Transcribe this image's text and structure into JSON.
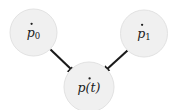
{
  "diagram": {
    "type": "directed-acyclic-graph",
    "background_color": "#ffffff",
    "node_fill_color": "#f0f0f0",
    "node_stroke_color": "#e2e2e2",
    "edge_color": "#1a1a1a",
    "label_color": "#202020",
    "nodes": [
      {
        "id": "p-dot-0",
        "base": "p",
        "accent": "dot",
        "subscript": "0",
        "paren": "",
        "label_plain": "ṗ0",
        "cx": 33.5,
        "cy": 32.5,
        "r": 23.5
      },
      {
        "id": "p-dot-1",
        "base": "p",
        "accent": "dot",
        "subscript": "1",
        "paren": "",
        "label_plain": "ṗ1",
        "cx": 144.0,
        "cy": 33.5,
        "r": 23.5
      },
      {
        "id": "p-dot-t",
        "base": "p",
        "accent": "dot",
        "subscript": "",
        "paren": "(t)",
        "label_plain": "ṗ(t)",
        "cx": 89.0,
        "cy": 87.0,
        "r": 25.0
      }
    ],
    "edges": [
      {
        "id": "edge-p0-to-pt",
        "from": "p-dot-0",
        "to": "p-dot-t",
        "arrow": "to"
      },
      {
        "id": "edge-p1-to-pt",
        "from": "p-dot-1",
        "to": "p-dot-t",
        "arrow": "to"
      }
    ]
  }
}
